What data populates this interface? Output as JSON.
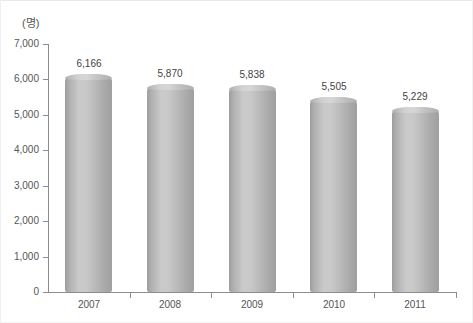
{
  "chart_data": {
    "type": "bar",
    "title": "",
    "subtitle": "",
    "xlabel": "",
    "ylabel": "",
    "unit_label": "(명)",
    "categories": [
      "2007",
      "2008",
      "2009",
      "2010",
      "2011"
    ],
    "values": [
      6166,
      5870,
      5838,
      5505,
      5229
    ],
    "value_labels": [
      "6,166",
      "5,870",
      "5,838",
      "5,505",
      "5,229"
    ],
    "ylim": [
      0,
      7000
    ],
    "ytick_values": [
      0,
      1000,
      2000,
      3000,
      4000,
      5000,
      6000,
      7000
    ],
    "ytick_labels": [
      "0",
      "1,000",
      "2,000",
      "3,000",
      "4,000",
      "5,000",
      "6,000",
      "7,000"
    ],
    "grid": false,
    "legend": null,
    "legend_position": "none",
    "series": [
      {
        "name": "",
        "values": [
          6166,
          5870,
          5838,
          5505,
          5229
        ]
      }
    ],
    "style": {
      "bar_shape": "cylinder",
      "bar_color_light": "#cacaca",
      "bar_color_dark": "#9d9d9d",
      "axis_color": "#8c8c8c",
      "text_color": "#555555",
      "background": "#ffffff"
    }
  }
}
